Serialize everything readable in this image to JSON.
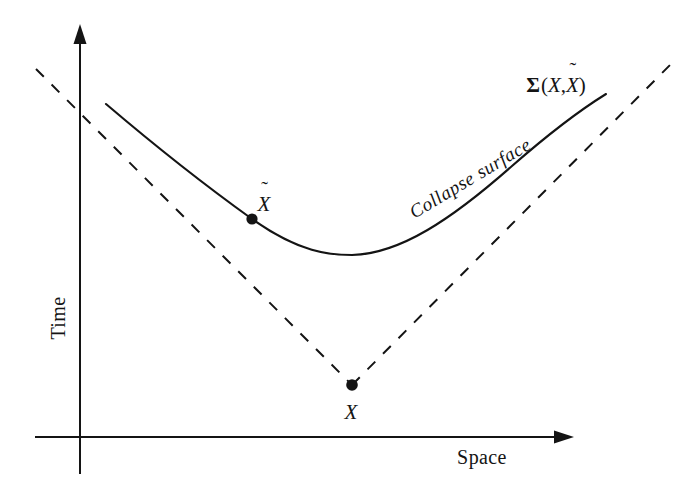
{
  "figure": {
    "kind": "spacetime-diagram",
    "background_color": "#ffffff",
    "ink_color": "#141414",
    "width": 693,
    "height": 489
  },
  "axes": {
    "y_axis": {
      "label": "Time",
      "orientation": "vertical",
      "arrow": "up",
      "x": 80,
      "top_y": 28,
      "bottom_y": 474,
      "label_x": 58,
      "label_y": 318,
      "label_rotation_deg": -90
    },
    "x_axis": {
      "label": "Space",
      "orientation": "horizontal",
      "arrow": "right",
      "y": 437,
      "left_x": 35,
      "right_x": 572,
      "label_x": 482,
      "label_y": 457
    }
  },
  "curves": {
    "collapse_surface": {
      "label": "Collapse surface",
      "style": "solid",
      "stroke_width": 2.0,
      "color": "#141414",
      "label_x": 470,
      "label_y": 178,
      "label_rotation_deg": -31,
      "path": "M 106,104 C 160,150 206,186 252,219 C 300,253 330,255 352,255 C 400,254 452,219 512,166 C 552,131 585,107 606,94",
      "end_label": "sigma"
    },
    "light_cone": {
      "style": "dashed",
      "dash_pattern": "11 11",
      "stroke_width": 2.0,
      "color": "#141414",
      "left_branch": {
        "x1": 36,
        "y1": 69,
        "x2": 352,
        "y2": 385
      },
      "right_branch": {
        "x1": 352,
        "y1": 385,
        "x2": 673,
        "y2": 62
      }
    }
  },
  "labels": {
    "sigma_surface": {
      "sigma": "Σ",
      "open_paren": "(",
      "arg1": "X",
      "comma": ",",
      "arg2": "X",
      "arg2_accent": "˜",
      "close_paren": ")",
      "full_text": "Σ(X,X̃)",
      "x": 556,
      "y": 85
    },
    "point_x": {
      "text": "X",
      "x": 351,
      "y": 412
    },
    "point_xtilde": {
      "text": "X",
      "accent": "˜",
      "full_text": "X̃",
      "x": 264,
      "y": 204
    }
  },
  "points": [
    {
      "name": "event-x",
      "label": "X",
      "x": 352,
      "y": 385,
      "radius": 5.5,
      "fill": "#141414"
    },
    {
      "name": "event-x-tilde",
      "label": "X̃",
      "x": 252,
      "y": 219,
      "radius": 5.5,
      "fill": "#141414"
    }
  ]
}
